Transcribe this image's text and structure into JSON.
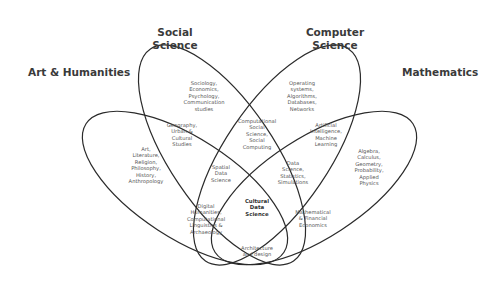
{
  "diagram": {
    "type": "venn",
    "sets": [
      {
        "name": "Art & Humanities"
      },
      {
        "name": "Social\nScience"
      },
      {
        "name": "Computer\nScience"
      },
      {
        "name": "Mathematics"
      }
    ],
    "regions": {
      "art_only": "Art,\nLiterature,\nReligion,\nPhilosophy,\nHistory,\nAnthropology",
      "social_only": "Sociology,\nEconomics,\nPsychology,\nCommunication\nstudies",
      "cs_only": "Operating\nsystems,\nAlgorithms,\nDatabases,\nNetworks",
      "math_only": "Algebra,\nCalculus,\nGeometry,\nProbability,\nApplied\nPhysics",
      "art_social": "Geography,\nUrban &\nCultural\nStudies",
      "social_cs": "Computational\nSocial\nScience,\nSocial\nComputing",
      "cs_math": "Artificial\nIntelligence,\nMachine\nLearning",
      "art_social_cs": "Spatial\nData\nScience",
      "social_cs_math": "Data\nScience,\nStatistics,\nSimulations",
      "art_cs": "Digital\nHumanities,\nComputational\nLinguistics &\nArchaeology",
      "social_math": "Mathematical\n& Financial\nEconomics",
      "all": "Cultural\nData\nScience",
      "art_math": "Architecture\nand design"
    },
    "line_color": "#2b2b2b",
    "background": "#ffffff"
  }
}
